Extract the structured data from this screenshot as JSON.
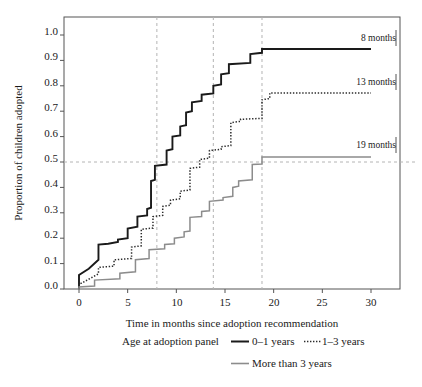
{
  "chart_data": {
    "type": "line",
    "title": "",
    "subtitle": "",
    "xlabel": "Time in months since adoption recommendation",
    "ylabel": "Proportion of children adopted",
    "xlim": [
      0,
      31
    ],
    "ylim": [
      0,
      1.0
    ],
    "xticks": [
      0,
      5,
      10,
      15,
      20,
      25,
      30
    ],
    "xtick_labels": [
      "0",
      "5",
      "10",
      "15",
      "20",
      "25",
      "30"
    ],
    "yticks": [
      0.0,
      0.1,
      0.2,
      0.3,
      0.4,
      0.5,
      0.6,
      0.7,
      0.8,
      0.9,
      1.0
    ],
    "ytick_labels": [
      "0.0",
      "0.1",
      "0.2",
      "0.3",
      "0.4",
      "0.5",
      "0.6",
      "0.7",
      "0.8",
      "0.9",
      "1.0"
    ],
    "grid": "dashed reference lines only",
    "legend_position": "below-axis",
    "reference_lines": {
      "horizontal": [
        0.5
      ],
      "vertical": [
        8,
        13.8,
        18.8
      ]
    },
    "annotations": [
      {
        "label": "8 months",
        "series": "0–1 years",
        "median_months": 8,
        "x": 29.6,
        "y": 0.945
      },
      {
        "label": "13 months",
        "series": "1–3 years",
        "median_months": 13,
        "x": 29.6,
        "y": 0.772
      },
      {
        "label": "19 months",
        "series": "More than 3 years",
        "median_months": 19,
        "x": 29.6,
        "y": 0.52
      }
    ],
    "series": [
      {
        "name": "0–1 years",
        "color": "#1a1a1a",
        "style": "solid",
        "width": 1.9,
        "points": [
          [
            0,
            0.0
          ],
          [
            0,
            0.055
          ],
          [
            1,
            0.08
          ],
          [
            2,
            0.115
          ],
          [
            2,
            0.175
          ],
          [
            3,
            0.178
          ],
          [
            4,
            0.185
          ],
          [
            4,
            0.195
          ],
          [
            5,
            0.2
          ],
          [
            5,
            0.238
          ],
          [
            6,
            0.245
          ],
          [
            6,
            0.285
          ],
          [
            7,
            0.29
          ],
          [
            7,
            0.315
          ],
          [
            7.4,
            0.32
          ],
          [
            7.4,
            0.425
          ],
          [
            7.8,
            0.43
          ],
          [
            7.8,
            0.485
          ],
          [
            9,
            0.49
          ],
          [
            9,
            0.545
          ],
          [
            9.6,
            0.55
          ],
          [
            9.6,
            0.6
          ],
          [
            10.4,
            0.605
          ],
          [
            10.4,
            0.64
          ],
          [
            11,
            0.645
          ],
          [
            11,
            0.695
          ],
          [
            11.6,
            0.7
          ],
          [
            11.6,
            0.735
          ],
          [
            12.6,
            0.74
          ],
          [
            12.6,
            0.765
          ],
          [
            13.8,
            0.77
          ],
          [
            13.8,
            0.8
          ],
          [
            14.6,
            0.805
          ],
          [
            14.6,
            0.845
          ],
          [
            15.4,
            0.85
          ],
          [
            15.4,
            0.885
          ],
          [
            17.6,
            0.89
          ],
          [
            17.6,
            0.925
          ],
          [
            18.8,
            0.93
          ],
          [
            18.8,
            0.945
          ],
          [
            30,
            0.945
          ]
        ]
      },
      {
        "name": "1–3 years",
        "color": "#2b2b2b",
        "style": "dotted",
        "width": 1.5,
        "points": [
          [
            0,
            0.0
          ],
          [
            0,
            0.018
          ],
          [
            0.6,
            0.03
          ],
          [
            2,
            0.06
          ],
          [
            2,
            0.085
          ],
          [
            3.6,
            0.09
          ],
          [
            3.6,
            0.115
          ],
          [
            5.4,
            0.12
          ],
          [
            5.4,
            0.165
          ],
          [
            6.4,
            0.17
          ],
          [
            6.4,
            0.235
          ],
          [
            7.6,
            0.24
          ],
          [
            7.6,
            0.285
          ],
          [
            8.6,
            0.29
          ],
          [
            8.6,
            0.325
          ],
          [
            9.4,
            0.33
          ],
          [
            9.4,
            0.35
          ],
          [
            10.4,
            0.355
          ],
          [
            10.4,
            0.385
          ],
          [
            11.4,
            0.39
          ],
          [
            11.4,
            0.475
          ],
          [
            12.4,
            0.48
          ],
          [
            12.4,
            0.51
          ],
          [
            13.4,
            0.515
          ],
          [
            13.4,
            0.545
          ],
          [
            14.6,
            0.55
          ],
          [
            14.6,
            0.56
          ],
          [
            15.6,
            0.565
          ],
          [
            15.6,
            0.655
          ],
          [
            16.6,
            0.66
          ],
          [
            16.6,
            0.668
          ],
          [
            18.8,
            0.672
          ],
          [
            18.8,
            0.745
          ],
          [
            19.6,
            0.75
          ],
          [
            19.6,
            0.772
          ],
          [
            30,
            0.772
          ]
        ]
      },
      {
        "name": "More than 3 years",
        "color": "#8c8c8c",
        "style": "solid",
        "width": 1.5,
        "points": [
          [
            0,
            0.0
          ],
          [
            0,
            0.008
          ],
          [
            1.6,
            0.012
          ],
          [
            1.6,
            0.035
          ],
          [
            4.2,
            0.04
          ],
          [
            4.2,
            0.062
          ],
          [
            5.8,
            0.068
          ],
          [
            5.8,
            0.115
          ],
          [
            7.2,
            0.12
          ],
          [
            7.2,
            0.155
          ],
          [
            8.8,
            0.158
          ],
          [
            8.8,
            0.175
          ],
          [
            9.8,
            0.178
          ],
          [
            9.8,
            0.2
          ],
          [
            10.8,
            0.205
          ],
          [
            10.8,
            0.225
          ],
          [
            11.4,
            0.228
          ],
          [
            11.4,
            0.282
          ],
          [
            12.6,
            0.285
          ],
          [
            12.6,
            0.305
          ],
          [
            13.4,
            0.308
          ],
          [
            13.4,
            0.345
          ],
          [
            14.8,
            0.35
          ],
          [
            14.8,
            0.36
          ],
          [
            15.8,
            0.365
          ],
          [
            15.8,
            0.4
          ],
          [
            16.4,
            0.405
          ],
          [
            16.4,
            0.425
          ],
          [
            17.8,
            0.43
          ],
          [
            17.8,
            0.49
          ],
          [
            18.8,
            0.492
          ],
          [
            18.8,
            0.52
          ],
          [
            30,
            0.52
          ]
        ]
      }
    ]
  },
  "legend": {
    "title": "Age at adoption panel",
    "items": [
      {
        "label": "0–1 years",
        "style": "solid",
        "color": "#1a1a1a"
      },
      {
        "label": "1–3 years",
        "style": "dotted",
        "color": "#2b2b2b"
      },
      {
        "label": "More than 3 years",
        "style": "solid",
        "color": "#8c8c8c"
      }
    ]
  },
  "axes": {
    "x_title": "Time in months since adoption recommendation",
    "y_title": "Proportion of children adopted"
  },
  "annotation_labels": {
    "a0": "8 months",
    "a1": "13 months",
    "a2": "19 months"
  },
  "xtick_labels": {
    "t0": "0",
    "t1": "5",
    "t2": "10",
    "t3": "15",
    "t4": "20",
    "t5": "25",
    "t6": "30"
  },
  "ytick_labels": {
    "t0": "0.0",
    "t1": "0.1",
    "t2": "0.2",
    "t3": "0.3",
    "t4": "0.4",
    "t5": "0.5",
    "t6": "0.6",
    "t7": "0.7",
    "t8": "0.8",
    "t9": "0.9",
    "t10": "1.0"
  }
}
